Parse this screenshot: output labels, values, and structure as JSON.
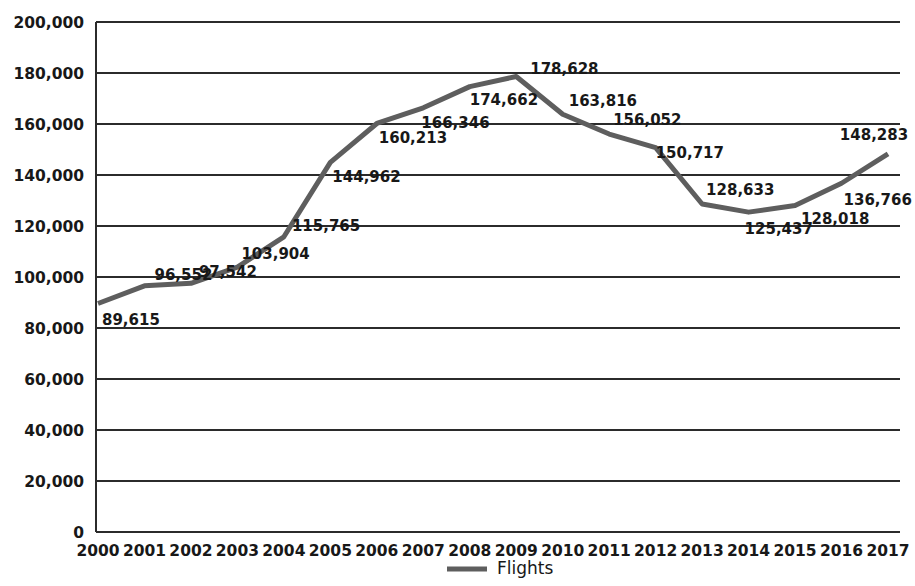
{
  "chart_data": {
    "type": "line",
    "title": "",
    "xlabel": "",
    "ylabel": "",
    "grid": true,
    "legend_position": "bottom",
    "ylim": [
      0,
      200000
    ],
    "ytick_labels": [
      "200,000",
      "180,000",
      "160,000",
      "140,000",
      "120,000",
      "100,000",
      "80,000",
      "60,000",
      "40,000",
      "20,000",
      "0"
    ],
    "ytick_values": [
      200000,
      180000,
      160000,
      140000,
      120000,
      100000,
      80000,
      60000,
      40000,
      20000,
      0
    ],
    "categories": [
      "2000",
      "2001",
      "2002",
      "2003",
      "2004",
      "2005",
      "2006",
      "2007",
      "2008",
      "2009",
      "2010",
      "2011",
      "2012",
      "2013",
      "2014",
      "2015",
      "2016",
      "2017"
    ],
    "series": [
      {
        "name": "Flights",
        "color": "#5e5e5e",
        "values": [
          89615,
          96552,
          97542,
          103904,
          115765,
          144962,
          160213,
          166346,
          174662,
          178628,
          163816,
          156052,
          150717,
          128633,
          125437,
          128018,
          136766,
          148283
        ],
        "value_labels": [
          "89,615",
          "96,552",
          "97,542",
          "103,904",
          "115,765",
          "144,962",
          "160,213",
          "166,346",
          "174,662",
          "178,628",
          "163,816",
          "156,052",
          "150,717",
          "128,633",
          "125,437",
          "128,018",
          "136,766",
          "148,283"
        ]
      }
    ],
    "legend": [
      {
        "label": "Flights",
        "color": "#5e5e5e"
      }
    ]
  }
}
